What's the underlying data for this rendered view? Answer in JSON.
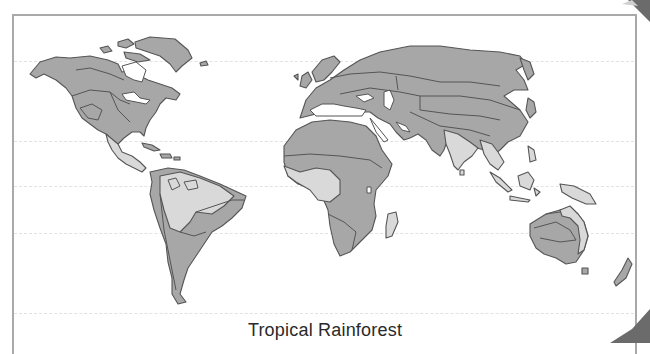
{
  "map": {
    "title": "Tropical Rainforest",
    "type": "world biome map",
    "highlighted_biome": "Tropical Rainforest",
    "colors": {
      "highlighted_region": "#d9d9d9",
      "other_land": "#a7a7a7",
      "outline": "#555555",
      "frame": "#a9a9a9",
      "latitude_lines": "#e2e2e2"
    },
    "highlighted_regions": [
      "Central America",
      "Amazon Basin",
      "Central Africa",
      "Madagascar",
      "India",
      "Southeast Asia",
      "Indonesia",
      "New Guinea",
      "Northern and eastern Australia coast"
    ],
    "latitude_lines": [
      {
        "name": "lat-60N",
        "y": 61
      },
      {
        "name": "lat-tropic-cancer",
        "y": 141
      },
      {
        "name": "lat-equator",
        "y": 186
      },
      {
        "name": "lat-tropic-capricorn",
        "y": 233
      },
      {
        "name": "lat-60S",
        "y": 313
      }
    ]
  }
}
